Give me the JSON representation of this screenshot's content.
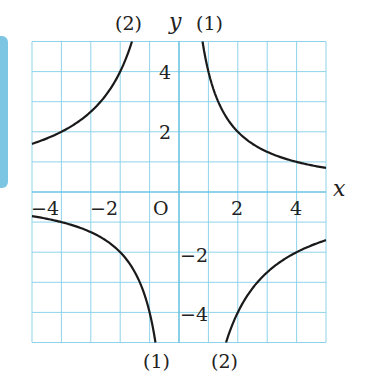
{
  "chart_data": {
    "type": "line",
    "title": "",
    "xlabel": "x",
    "ylabel": "y",
    "xlim": [
      -5,
      5
    ],
    "ylim": [
      -5,
      5
    ],
    "grid": true,
    "origin_label": "O",
    "x_ticks": [
      {
        "value": -4,
        "label": "−4"
      },
      {
        "value": -2,
        "label": "−2"
      },
      {
        "value": 2,
        "label": "2"
      },
      {
        "value": 4,
        "label": "4"
      }
    ],
    "y_ticks": [
      {
        "value": 4,
        "label": "4"
      },
      {
        "value": 2,
        "label": "2"
      },
      {
        "value": -2,
        "label": "−2"
      },
      {
        "value": -4,
        "label": "−4"
      }
    ],
    "series": [
      {
        "name": "(1)",
        "formula": "y = 4/x",
        "k": 4,
        "points": [
          [
            0.8,
            5
          ],
          [
            1,
            4
          ],
          [
            2,
            2
          ],
          [
            4,
            1
          ],
          [
            5,
            0.8
          ],
          [
            -0.8,
            -5
          ],
          [
            -1,
            -4
          ],
          [
            -2,
            -2
          ],
          [
            -4,
            -1
          ],
          [
            -5,
            -0.8
          ]
        ]
      },
      {
        "name": "(2)",
        "formula": "y = -8/x",
        "k": -8,
        "points": [
          [
            -1.6,
            5
          ],
          [
            -2,
            4
          ],
          [
            -4,
            2
          ],
          [
            -5,
            1.6
          ],
          [
            1.6,
            -5
          ],
          [
            2,
            -4
          ],
          [
            4,
            -2
          ],
          [
            5,
            -1.6
          ]
        ]
      }
    ],
    "annotations": [
      {
        "text": "(2)",
        "position": "top, above left branch of curve 2"
      },
      {
        "text": "(1)",
        "position": "top, above right branch of curve 1"
      },
      {
        "text": "(1)",
        "position": "bottom, below left branch of curve 1"
      },
      {
        "text": "(2)",
        "position": "bottom, below right branch of curve 2"
      }
    ]
  },
  "labels": {
    "x_axis": "x",
    "y_axis": "y",
    "origin": "O",
    "top_curve2": "(2)",
    "top_curve1": "(1)",
    "bottom_curve1": "(1)",
    "bottom_curve2": "(2)",
    "xt_m4": "−4",
    "xt_m2": "−2",
    "xt_2": "2",
    "xt_4": "4",
    "yt_4": "4",
    "yt_2": "2",
    "yt_m2": "−2",
    "yt_m4": "−4"
  },
  "colors": {
    "grid": "#8fd3ea",
    "axis": "#6cc3e3",
    "curve": "#1a1a1a",
    "side_bar": "#7cc6e4"
  }
}
